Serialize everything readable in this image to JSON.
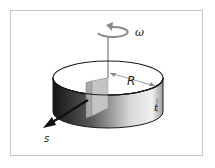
{
  "figure": {
    "labels": {
      "omega": "ω",
      "radius": "R",
      "thickness": "t",
      "direction": "s"
    },
    "colors": {
      "frame": "#c8c8c8",
      "outline": "#1a1a1a",
      "block": "#b8b8b8",
      "arrow": "#111111"
    }
  }
}
